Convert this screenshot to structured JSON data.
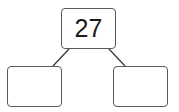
{
  "diagram": {
    "type": "number-bond",
    "whole": "27",
    "parts": [
      "",
      ""
    ]
  }
}
